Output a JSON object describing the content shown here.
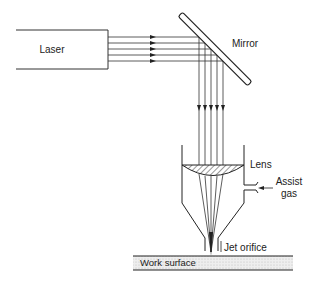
{
  "diagram": {
    "type": "laser-cutting-schematic",
    "labels": {
      "laser": "Laser",
      "mirror": "Mirror",
      "lens": "Lens",
      "assist_gas_line1": "Assist",
      "assist_gas_line2": "gas",
      "jet_orifice": "Jet orifice",
      "work_surface": "Work surface"
    },
    "beam_count": 5,
    "colors": {
      "line": "#222222",
      "work_surface_fill": "#e6e6e6",
      "background": "#ffffff"
    }
  }
}
